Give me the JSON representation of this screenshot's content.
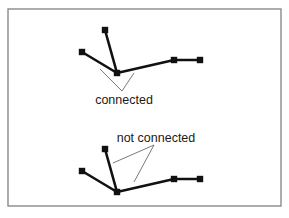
{
  "figure": {
    "frame": {
      "x": 8,
      "y": 9,
      "width": 273,
      "height": 197,
      "stroke": "#8a8a8a"
    },
    "colors": {
      "edge": "#111111",
      "node": "#111111",
      "pointer": "#6a6a6a",
      "text": "#1a1a1a"
    },
    "panels": [
      {
        "id": "connected",
        "label": "connected",
        "label_pos": {
          "x": 124,
          "y": 104
        },
        "nodes": [
          {
            "id": "top",
            "x": 105,
            "y": 30
          },
          {
            "id": "left",
            "x": 82,
            "y": 52
          },
          {
            "id": "hub",
            "x": 117,
            "y": 73
          },
          {
            "id": "mid-right",
            "x": 174,
            "y": 60
          },
          {
            "id": "far-right",
            "x": 200,
            "y": 60
          }
        ],
        "edges": [
          [
            "top",
            "hub"
          ],
          [
            "left",
            "hub"
          ],
          [
            "hub",
            "mid-right"
          ],
          [
            "mid-right",
            "far-right"
          ]
        ],
        "pointers": [
          {
            "x1": 100,
            "y1": 69,
            "x2": 122,
            "y2": 91
          },
          {
            "x1": 134,
            "y1": 73,
            "x2": 122,
            "y2": 91
          }
        ]
      },
      {
        "id": "not-connected",
        "label": "not connected",
        "label_pos": {
          "x": 156,
          "y": 142
        },
        "nodes": [
          {
            "id": "top",
            "x": 105,
            "y": 149
          },
          {
            "id": "left",
            "x": 82,
            "y": 171
          },
          {
            "id": "hub",
            "x": 117,
            "y": 192
          },
          {
            "id": "mid-right",
            "x": 174,
            "y": 179
          },
          {
            "id": "far-right",
            "x": 200,
            "y": 179
          }
        ],
        "edges": [
          [
            "top",
            "hub"
          ],
          [
            "left",
            "hub"
          ],
          [
            "hub",
            "mid-right"
          ],
          [
            "mid-right",
            "far-right"
          ]
        ],
        "pointers": [
          {
            "x1": 154,
            "y1": 145,
            "x2": 113,
            "y2": 163
          },
          {
            "x1": 154,
            "y1": 145,
            "x2": 134,
            "y2": 182
          }
        ]
      }
    ]
  }
}
